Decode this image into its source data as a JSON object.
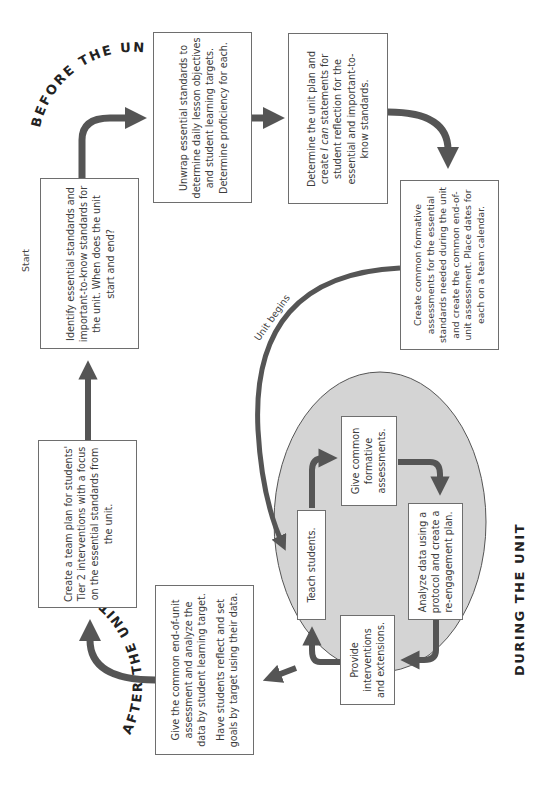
{
  "diagram": {
    "orientation": "rotated 90° counter-clockwise",
    "phases": {
      "before": "BEFORE THE UNIT",
      "during": "DURING THE UNIT",
      "after": "AFTER THE UNIT"
    },
    "labels": {
      "start": "Start",
      "unit_begins": "Unit begins"
    },
    "steps": {
      "identify": "Identify essential standards and important-to-know standards for the unit. When does the unit start and end?",
      "unwrap": "Unwrap essential standards to determine daily lesson objectives and student learning targets. Determine proficiency for each.",
      "determine_pre": "Determine the unit plan and create ",
      "determine_em": "I can",
      "determine_post": " statements for student reflection for the essential and important-to-know standards.",
      "create_common": "Create common formative assessments for the essential standards needed during the unit and create the common end-of-unit assessment. Place dates for each on a team calendar.",
      "give_end": "Give the common end-of-unit assessment and analyze the data by student learning target.",
      "reflect": "Have students reflect and set goals by target using their data.",
      "team_plan": "Create a team plan for students' Tier 2 interventions with a focus on the essential standards from the unit."
    },
    "cycle": {
      "teach": "Teach students.",
      "give_formative": "Give common formative assessments.",
      "analyze": "Analyze data using a protocol and create a re-engagement plan.",
      "provide": "Provide interventions and extensions."
    },
    "colors": {
      "arrow": "#555555",
      "oval_fill": "#d4d4d4",
      "box_border": "#6e6e6e",
      "text": "#3c3c3c"
    }
  }
}
